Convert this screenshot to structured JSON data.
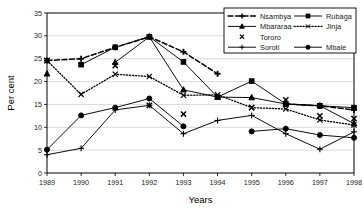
{
  "chart_data": {
    "type": "line",
    "title": "",
    "xlabel": "Years",
    "ylabel": "Per cent",
    "categories": [
      1989,
      1990,
      1991,
      1992,
      1993,
      1994,
      1995,
      1996,
      1997,
      1998
    ],
    "xtick_labels": [
      "1989",
      "1990",
      "1991",
      "1992",
      "1993",
      "1994",
      "1995",
      "1996",
      "1997",
      "1998"
    ],
    "ytick_labels": [
      "0",
      "5",
      "10",
      "15",
      "20",
      "25",
      "30",
      "35"
    ],
    "ytick_values": [
      0,
      5,
      10,
      15,
      20,
      25,
      30,
      35
    ],
    "ylim": [
      0,
      35
    ],
    "xlim": [
      1989,
      1998
    ],
    "grid": "horizontal",
    "legend_position": "top-right",
    "series": [
      {
        "name": "Nsambya",
        "marker": "plus-filled",
        "line_style": "dashed",
        "values": [
          24.6,
          25.0,
          27.5,
          29.8,
          26.5,
          21.7,
          null,
          15.1,
          14.7,
          13.8
        ]
      },
      {
        "name": "Rubaga",
        "marker": "square",
        "line_style": "solid",
        "values": [
          null,
          23.7,
          27.5,
          29.8,
          24.3,
          16.6,
          20.1,
          15.1,
          14.7,
          14.3
        ]
      },
      {
        "name": "Mbararaa",
        "marker": "triangle",
        "line_style": "solid",
        "values": [
          21.7,
          null,
          24.2,
          29.8,
          18.2,
          16.6,
          16.5,
          15.1,
          14.7,
          10.8
        ]
      },
      {
        "name": "Jinja",
        "marker": "x",
        "line_style": "dotted",
        "values": [
          24.6,
          17.2,
          21.6,
          21.1,
          17.0,
          17.1,
          14.3,
          14.0,
          11.6,
          10.5
        ]
      },
      {
        "name": "Tororo",
        "marker": "x-bold",
        "line_style": "none",
        "values": [
          24.6,
          null,
          23.5,
          14.8,
          12.9,
          null,
          14.3,
          16.0,
          12.5,
          11.9
        ]
      },
      {
        "name": "Soroti",
        "marker": "plus",
        "line_style": "solid",
        "values": [
          4.0,
          5.4,
          13.8,
          14.8,
          8.6,
          11.5,
          12.6,
          8.6,
          5.2,
          9.0
        ]
      },
      {
        "name": "Mbale",
        "marker": "circle",
        "line_style": "solid",
        "values": [
          5.1,
          12.6,
          14.3,
          16.3,
          10.2,
          null,
          9.1,
          9.7,
          8.3,
          7.7
        ]
      }
    ]
  },
  "legend": {
    "entries": [
      {
        "label": "Nsambya"
      },
      {
        "label": "Rubaga"
      },
      {
        "label": "Mbararaa"
      },
      {
        "label": "Jinja"
      },
      {
        "label": "Tororo"
      },
      {
        "label": "Soroti"
      },
      {
        "label": "Mbale"
      }
    ]
  },
  "colors": {
    "line": "#000000",
    "grid": "#c9c9c9",
    "text": "#1a1a1a",
    "background": "#ffffff"
  }
}
